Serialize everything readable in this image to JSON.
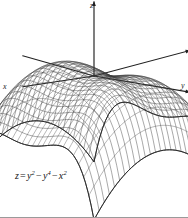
{
  "figure": {
    "kind": "3d-surface-wireframe",
    "background_color": "#ffffff",
    "mesh_color": "#3a3a3a",
    "axis_color": "#202020",
    "border_color": "#9a9a9a"
  },
  "axes": {
    "z_label": "z",
    "x_label": "x",
    "y_label": "y"
  },
  "caption": {
    "lhs": "z",
    "equals": "=",
    "term1_base": "y",
    "term1_exp": "2",
    "minus1": "−",
    "term2_base": "y",
    "term2_exp": "4",
    "minus2": "−",
    "term3_base": "x",
    "term3_exp": "2",
    "full_text": "z = y² − y⁴ − x²"
  },
  "chart_data": {
    "type": "surface",
    "title": "",
    "equation": "z = y^2 - y^4 - x^2",
    "xlabel": "x",
    "ylabel": "y",
    "zlabel": "z",
    "xlim": [
      -1.45,
      1.45
    ],
    "ylim": [
      -1.45,
      1.45
    ],
    "zlim": [
      -4.4,
      0.3
    ],
    "grid": true,
    "legend": false,
    "mesh_u_lines": 26,
    "mesh_v_lines": 26,
    "projection": {
      "type": "oblique",
      "origin_px": [
        94,
        76
      ],
      "x_axis_vector_px": [
        -46,
        10
      ],
      "y_axis_vector_px": [
        46,
        10
      ],
      "z_scale_px_per_unit": 26
    },
    "features": [
      {
        "name": "peak",
        "x": 0.0,
        "y": -0.7071,
        "z": 0.25
      },
      {
        "name": "peak",
        "x": 0.0,
        "y": 0.7071,
        "z": 0.25
      },
      {
        "name": "saddle-origin",
        "x": 0.0,
        "y": 0.0,
        "z": 0.0
      }
    ]
  }
}
